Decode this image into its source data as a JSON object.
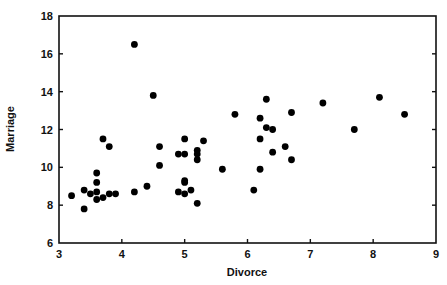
{
  "chart_data": {
    "type": "scatter",
    "title": "",
    "xlabel": "Divorce",
    "ylabel": "Marriage",
    "xlim": [
      3,
      9
    ],
    "ylim": [
      6,
      18
    ],
    "xticks": [
      3,
      4,
      5,
      6,
      7,
      8,
      9
    ],
    "yticks": [
      6,
      8,
      10,
      12,
      14,
      16,
      18
    ],
    "grid": false,
    "legend": null,
    "marker_color": "#000000",
    "points": [
      {
        "x": 3.2,
        "y": 8.5
      },
      {
        "x": 3.4,
        "y": 8.8
      },
      {
        "x": 3.4,
        "y": 7.8
      },
      {
        "x": 3.5,
        "y": 8.6
      },
      {
        "x": 3.6,
        "y": 9.7
      },
      {
        "x": 3.6,
        "y": 9.2
      },
      {
        "x": 3.6,
        "y": 8.7
      },
      {
        "x": 3.6,
        "y": 8.3
      },
      {
        "x": 3.7,
        "y": 8.4
      },
      {
        "x": 3.8,
        "y": 8.6
      },
      {
        "x": 3.9,
        "y": 8.6
      },
      {
        "x": 3.7,
        "y": 11.5
      },
      {
        "x": 3.8,
        "y": 11.1
      },
      {
        "x": 4.2,
        "y": 16.5
      },
      {
        "x": 4.2,
        "y": 8.7
      },
      {
        "x": 4.4,
        "y": 9.0
      },
      {
        "x": 4.5,
        "y": 13.8
      },
      {
        "x": 4.6,
        "y": 11.1
      },
      {
        "x": 4.6,
        "y": 10.1
      },
      {
        "x": 4.9,
        "y": 10.7
      },
      {
        "x": 5.0,
        "y": 10.7
      },
      {
        "x": 5.0,
        "y": 11.5
      },
      {
        "x": 5.2,
        "y": 10.9
      },
      {
        "x": 5.2,
        "y": 10.7
      },
      {
        "x": 5.2,
        "y": 10.4
      },
      {
        "x": 5.3,
        "y": 11.4
      },
      {
        "x": 5.0,
        "y": 9.3
      },
      {
        "x": 5.0,
        "y": 9.2
      },
      {
        "x": 4.9,
        "y": 8.7
      },
      {
        "x": 5.0,
        "y": 8.6
      },
      {
        "x": 5.1,
        "y": 8.8
      },
      {
        "x": 5.2,
        "y": 8.1
      },
      {
        "x": 5.6,
        "y": 9.9
      },
      {
        "x": 5.8,
        "y": 12.8
      },
      {
        "x": 6.1,
        "y": 8.8
      },
      {
        "x": 6.2,
        "y": 12.6
      },
      {
        "x": 6.2,
        "y": 11.5
      },
      {
        "x": 6.2,
        "y": 9.9
      },
      {
        "x": 6.3,
        "y": 13.6
      },
      {
        "x": 6.3,
        "y": 12.1
      },
      {
        "x": 6.4,
        "y": 12.0
      },
      {
        "x": 6.4,
        "y": 10.8
      },
      {
        "x": 6.6,
        "y": 11.1
      },
      {
        "x": 6.7,
        "y": 12.9
      },
      {
        "x": 6.7,
        "y": 10.4
      },
      {
        "x": 7.2,
        "y": 13.4
      },
      {
        "x": 7.7,
        "y": 12.0
      },
      {
        "x": 8.1,
        "y": 13.7
      },
      {
        "x": 8.5,
        "y": 12.8
      }
    ]
  }
}
